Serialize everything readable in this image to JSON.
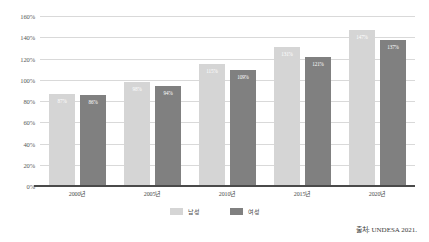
{
  "chart_data": {
    "type": "bar",
    "title": "",
    "xlabel": "",
    "ylabel": "",
    "ylim": [
      0,
      160
    ],
    "ytick_step": 20,
    "grid": true,
    "legend_position": "bottom-center",
    "categories": [
      "2000년",
      "2005년",
      "2010년",
      "2015년",
      "2020년"
    ],
    "ytick_labels": [
      "160%",
      "140%",
      "120%",
      "100%",
      "80%",
      "60%",
      "40%",
      "20%",
      "0%"
    ],
    "ytick_values": [
      160,
      140,
      120,
      100,
      80,
      60,
      40,
      20,
      0
    ],
    "series": [
      {
        "name": "남성",
        "color": "#d5d5d5",
        "values": [
          87,
          98,
          115,
          131,
          147
        ],
        "value_labels": [
          "87%",
          "98%",
          "115%",
          "131%",
          "147%"
        ]
      },
      {
        "name": "여성",
        "color": "#808080",
        "values": [
          86,
          94,
          109,
          121,
          137
        ],
        "value_labels": [
          "86%",
          "94%",
          "109%",
          "121%",
          "137%"
        ]
      }
    ],
    "source_note": "출처: UNDESA 2021."
  },
  "colors": {
    "male_bar": "#d5d5d5",
    "female_bar": "#808080",
    "gridline": "#d9d9d9",
    "axis_line": "#4a4a4a",
    "background": "#ffffff",
    "tick_text": "#5a5a5a",
    "data_label_text": "#ffffff"
  }
}
